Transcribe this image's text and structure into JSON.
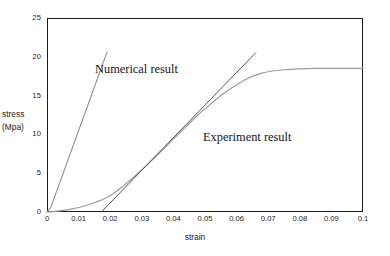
{
  "chart_data": {
    "type": "line",
    "title": "",
    "xlabel": "strain",
    "ylabel_line1": "stress",
    "ylabel_line2": "(Mpa)",
    "xlim": [
      0,
      0.1
    ],
    "ylim": [
      0,
      25
    ],
    "grid": false,
    "legend_position": "inline-annotations",
    "xticks": [
      "0",
      "0.01",
      "0.02",
      "0.03",
      "0.04",
      "0.05",
      "0.06",
      "0.07",
      "0.08",
      "0.09",
      "0.1"
    ],
    "xtick_values": [
      0,
      0.01,
      0.02,
      0.03,
      0.04,
      0.05,
      0.06,
      0.07,
      0.08,
      0.09,
      0.1
    ],
    "yticks": [
      "0",
      "5",
      "10",
      "15",
      "20",
      "25"
    ],
    "ytick_values": [
      0,
      5,
      10,
      15,
      20,
      25
    ],
    "series": [
      {
        "name": "Numerical result",
        "color": "#8c8c8c",
        "style": "straight-line",
        "x": [
          0.0,
          0.0012,
          0.019
        ],
        "values": [
          0.0,
          0.6,
          20.6
        ]
      },
      {
        "name": "Experiment result",
        "color": "#9a9a9a",
        "style": "smooth-curve",
        "x": [
          0.0,
          0.004,
          0.008,
          0.012,
          0.016,
          0.02,
          0.024,
          0.028,
          0.032,
          0.036,
          0.04,
          0.044,
          0.048,
          0.052,
          0.056,
          0.06,
          0.064,
          0.068,
          0.072,
          0.076,
          0.08,
          0.085,
          0.09,
          0.095,
          0.1
        ],
        "values": [
          0.0,
          0.15,
          0.4,
          0.8,
          1.35,
          2.1,
          3.3,
          4.7,
          6.2,
          7.8,
          9.4,
          11.0,
          12.6,
          14.0,
          15.3,
          16.4,
          17.3,
          17.9,
          18.2,
          18.35,
          18.45,
          18.5,
          18.5,
          18.5,
          18.5
        ]
      },
      {
        "name": "Experiment result tangent",
        "color": "#555555",
        "style": "straight-line",
        "x": [
          0.0172,
          0.066
        ],
        "values": [
          0.0,
          20.5
        ]
      }
    ],
    "annotations": [
      {
        "text": "Numerical result",
        "x": 0.0165,
        "y": 17.3
      },
      {
        "text": "Experiment result",
        "x": 0.05,
        "y": 9.6
      }
    ]
  },
  "axes": {
    "frame_color": "#1a1a1a"
  }
}
